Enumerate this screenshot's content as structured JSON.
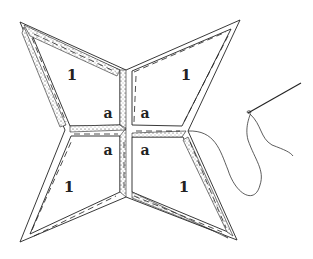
{
  "diagram": {
    "title": "",
    "labels": {
      "patch_top_left": "1",
      "patch_top_right": "1",
      "patch_bottom_left": "1",
      "patch_bottom_right": "1",
      "seam_top_left": "a",
      "seam_top_right": "a",
      "seam_bottom_left": "a",
      "seam_bottom_right": "a"
    },
    "colors": {
      "ink": "#222222",
      "paper": "#ffffff"
    }
  }
}
